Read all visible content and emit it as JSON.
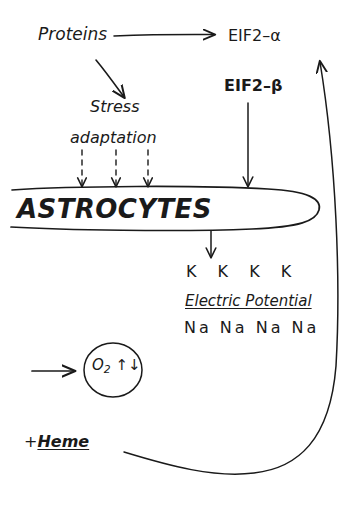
{
  "diagram": {
    "background_color": "#ffffff",
    "stroke_color": "#1a1a1a",
    "style": "hand-drawn"
  },
  "nodes": {
    "proteins": "Proteins",
    "eif2_alpha": "EIF2–α",
    "eif2_beta": "EIF2–β",
    "stress": "Stress",
    "adaptation": "adaptation",
    "astrocytes": "ASTROCYTES",
    "potassium_row": "K  K  K  K",
    "electric_potential": "Electric Potential",
    "sodium_row": "Na  Na  Na  Na",
    "oxygen_symbol": "O",
    "oxygen_subscript": "2",
    "oxygen_flux": "↑↓",
    "heme_plus": "+",
    "heme_word": "Heme"
  },
  "edges": [
    {
      "name": "proteins-to-eif2alpha",
      "from": "Proteins",
      "to": "EIF2–α",
      "style": "solid-arrow"
    },
    {
      "name": "proteins-to-stress",
      "from": "Proteins",
      "to": "Stress",
      "style": "solid-arrow-diagonal"
    },
    {
      "name": "adaptation-to-astrocytes-1",
      "from": "adaptation",
      "to": "ASTROCYTES",
      "style": "dashed-arrow"
    },
    {
      "name": "adaptation-to-astrocytes-2",
      "from": "adaptation",
      "to": "ASTROCYTES",
      "style": "dashed-arrow"
    },
    {
      "name": "adaptation-to-astrocytes-3",
      "from": "adaptation",
      "to": "ASTROCYTES",
      "style": "dashed-arrow"
    },
    {
      "name": "eif2beta-to-astrocytes",
      "from": "EIF2–β",
      "to": "ASTROCYTES",
      "style": "solid-arrow"
    },
    {
      "name": "astrocytes-to-ions",
      "from": "ASTROCYTES",
      "to": "Electric Potential",
      "style": "solid-arrow"
    },
    {
      "name": "input-to-oxygen",
      "from": "",
      "to": "O₂ ↑↓",
      "style": "solid-arrow"
    },
    {
      "name": "heme-feedback-to-eif2alpha",
      "from": "+Heme",
      "to": "EIF2–α",
      "style": "curved-feedback-arrow"
    }
  ],
  "shapes": [
    {
      "name": "astrocytes-ellipse",
      "type": "ellipse"
    },
    {
      "name": "oxygen-ellipse",
      "type": "ellipse"
    }
  ]
}
